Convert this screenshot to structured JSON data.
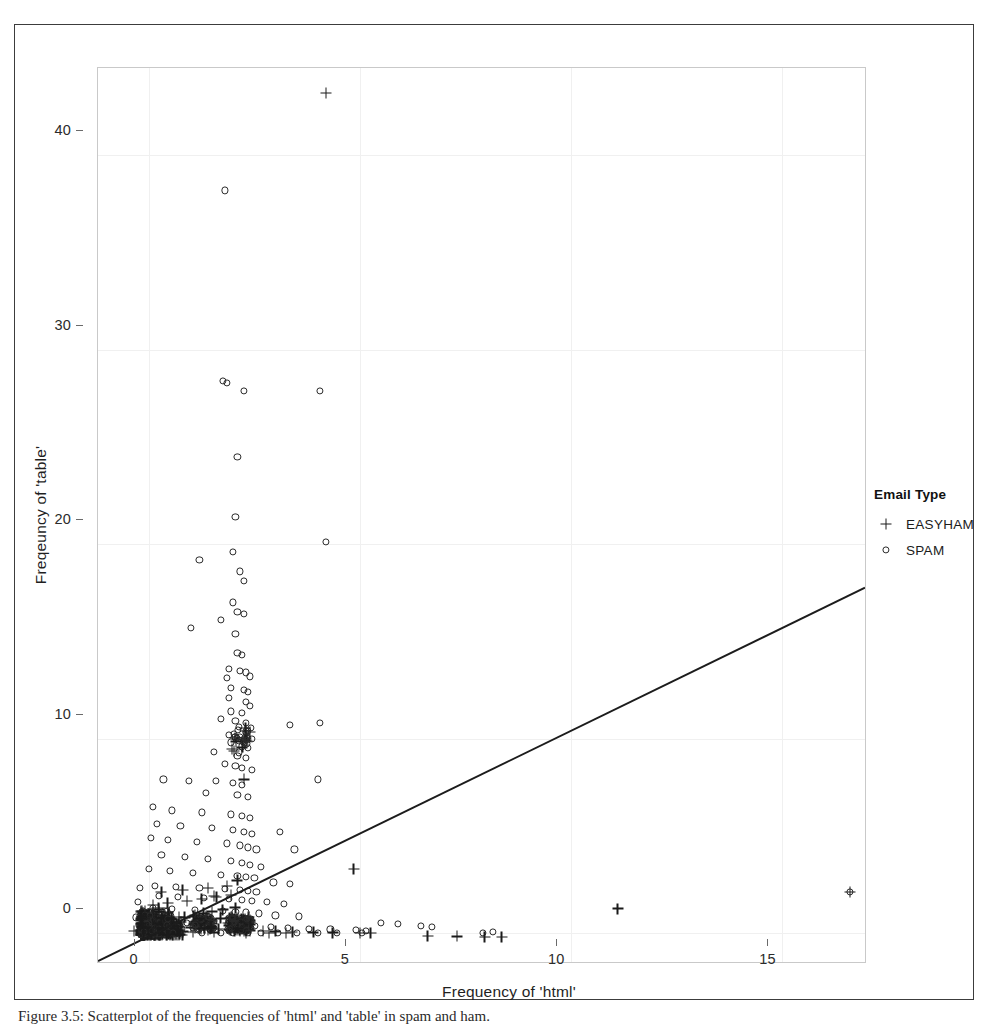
{
  "figure": {
    "caption": "Figure 3.5: Scatterplot of the frequencies of 'html' and 'table' in spam and ham."
  },
  "axes": {
    "x_title": "Frequency of 'html'",
    "y_title": "Freqeuncy of 'table'",
    "x_ticks": [
      "0",
      "5",
      "10",
      "15"
    ],
    "y_ticks": [
      "0",
      "10",
      "20",
      "30",
      "40"
    ]
  },
  "legend": {
    "title": "Email Type",
    "entries": [
      {
        "label": "EASYHAM",
        "marker": "plus-icon",
        "color": "#1a1a1a"
      },
      {
        "label": "SPAM",
        "marker": "circle-open-icon",
        "color": "#2a2a2a"
      }
    ]
  },
  "chart_data": {
    "type": "scatter",
    "title": "",
    "xlabel": "Frequency of 'html'",
    "ylabel": "Freqeuncy of 'table'",
    "xlim": [
      -1.2,
      17.0
    ],
    "ylim": [
      -1.6,
      44.5
    ],
    "xticks": [
      0,
      5,
      10,
      15
    ],
    "yticks": [
      0,
      10,
      20,
      30,
      40
    ],
    "grid": true,
    "legend_position": "right-outside",
    "series": [
      {
        "name": "SPAM",
        "marker": "open-circle",
        "color": "#2a2a2a",
        "points": [
          [
            1.8,
            38.2
          ],
          [
            1.75,
            28.4
          ],
          [
            1.85,
            28.3
          ],
          [
            2.25,
            27.9
          ],
          [
            4.05,
            27.9
          ],
          [
            2.1,
            24.5
          ],
          [
            2.05,
            21.4
          ],
          [
            2.0,
            19.6
          ],
          [
            2.15,
            18.6
          ],
          [
            1.2,
            19.2
          ],
          [
            2.25,
            18.1
          ],
          [
            4.2,
            20.1
          ],
          [
            2.0,
            17.0
          ],
          [
            2.1,
            16.5
          ],
          [
            2.25,
            16.4
          ],
          [
            1.7,
            16.1
          ],
          [
            2.05,
            15.4
          ],
          [
            1.0,
            15.7
          ],
          [
            2.1,
            14.4
          ],
          [
            2.2,
            14.3
          ],
          [
            1.9,
            13.6
          ],
          [
            2.15,
            13.5
          ],
          [
            2.3,
            13.4
          ],
          [
            1.85,
            13.1
          ],
          [
            2.4,
            13.2
          ],
          [
            1.95,
            12.6
          ],
          [
            2.25,
            12.5
          ],
          [
            2.35,
            12.4
          ],
          [
            1.9,
            12.1
          ],
          [
            2.3,
            11.9
          ],
          [
            2.4,
            11.7
          ],
          [
            1.95,
            11.4
          ],
          [
            2.2,
            11.3
          ],
          [
            1.7,
            11.0
          ],
          [
            2.05,
            10.9
          ],
          [
            2.3,
            10.8
          ],
          [
            3.35,
            10.7
          ],
          [
            4.05,
            10.8
          ],
          [
            1.9,
            10.2
          ],
          [
            2.15,
            10.1
          ],
          [
            2.25,
            10.0
          ],
          [
            2.45,
            10.0
          ],
          [
            1.95,
            9.8
          ],
          [
            2.2,
            9.6
          ],
          [
            2.35,
            9.5
          ],
          [
            1.55,
            9.3
          ],
          [
            2.1,
            9.1
          ],
          [
            2.3,
            9.0
          ],
          [
            1.8,
            8.7
          ],
          [
            2.05,
            8.6
          ],
          [
            2.2,
            8.5
          ],
          [
            2.45,
            8.4
          ],
          [
            0.35,
            7.9
          ],
          [
            0.95,
            7.8
          ],
          [
            1.6,
            7.8
          ],
          [
            2.0,
            7.7
          ],
          [
            2.2,
            7.6
          ],
          [
            4.0,
            7.9
          ],
          [
            1.35,
            7.2
          ],
          [
            2.1,
            7.1
          ],
          [
            2.35,
            7.0
          ],
          [
            0.1,
            6.5
          ],
          [
            0.55,
            6.3
          ],
          [
            1.25,
            6.2
          ],
          [
            1.95,
            6.1
          ],
          [
            2.2,
            6.0
          ],
          [
            2.4,
            5.9
          ],
          [
            0.2,
            5.6
          ],
          [
            0.75,
            5.5
          ],
          [
            1.5,
            5.4
          ],
          [
            2.0,
            5.3
          ],
          [
            2.25,
            5.2
          ],
          [
            2.45,
            5.1
          ],
          [
            3.1,
            5.2
          ],
          [
            0.05,
            4.9
          ],
          [
            0.45,
            4.8
          ],
          [
            1.15,
            4.7
          ],
          [
            1.85,
            4.6
          ],
          [
            2.15,
            4.5
          ],
          [
            2.35,
            4.4
          ],
          [
            2.55,
            4.3
          ],
          [
            3.45,
            4.3
          ],
          [
            0.3,
            4.0
          ],
          [
            0.85,
            3.9
          ],
          [
            1.4,
            3.8
          ],
          [
            1.95,
            3.7
          ],
          [
            2.2,
            3.6
          ],
          [
            2.4,
            3.5
          ],
          [
            2.65,
            3.4
          ],
          [
            0.0,
            3.3
          ],
          [
            0.5,
            3.2
          ],
          [
            1.05,
            3.1
          ],
          [
            1.7,
            3.0
          ],
          [
            2.1,
            2.95
          ],
          [
            2.3,
            2.9
          ],
          [
            2.5,
            2.85
          ],
          [
            2.95,
            2.6
          ],
          [
            3.35,
            2.5
          ],
          [
            0.15,
            2.4
          ],
          [
            0.65,
            2.35
          ],
          [
            1.2,
            2.3
          ],
          [
            1.8,
            2.25
          ],
          [
            2.15,
            2.2
          ],
          [
            2.35,
            2.15
          ],
          [
            2.55,
            2.1
          ],
          [
            0.25,
            1.9
          ],
          [
            0.7,
            1.85
          ],
          [
            1.3,
            1.8
          ],
          [
            1.9,
            1.75
          ],
          [
            2.2,
            1.7
          ],
          [
            2.45,
            1.65
          ],
          [
            2.8,
            1.6
          ],
          [
            3.2,
            1.5
          ],
          [
            0.1,
            1.3
          ],
          [
            0.55,
            1.25
          ],
          [
            1.1,
            1.2
          ],
          [
            1.75,
            1.15
          ],
          [
            2.05,
            1.1
          ],
          [
            2.3,
            1.05
          ],
          [
            2.6,
            1.0
          ],
          [
            3.0,
            0.9
          ],
          [
            3.55,
            0.85
          ],
          [
            0.0,
            0.6
          ],
          [
            0.4,
            0.55
          ],
          [
            0.9,
            0.5
          ],
          [
            1.45,
            0.45
          ],
          [
            1.95,
            0.4
          ],
          [
            2.25,
            0.38
          ],
          [
            2.5,
            0.35
          ],
          [
            2.9,
            0.3
          ],
          [
            3.3,
            0.25
          ],
          [
            3.8,
            0.2
          ],
          [
            4.3,
            0.18
          ],
          [
            4.9,
            0.15
          ],
          [
            5.15,
            0.12
          ],
          [
            -0.15,
            0.05
          ],
          [
            0.2,
            0.04
          ],
          [
            0.7,
            0.03
          ],
          [
            1.25,
            0.02
          ],
          [
            1.7,
            0.02
          ],
          [
            2.0,
            0.0
          ],
          [
            2.35,
            0.0
          ],
          [
            2.65,
            0.0
          ],
          [
            3.05,
            0.0
          ],
          [
            3.5,
            0.0
          ],
          [
            4.0,
            0.0
          ],
          [
            4.45,
            0.0
          ],
          [
            5.05,
            0.0
          ],
          [
            7.9,
            0.0
          ],
          [
            8.15,
            0.05
          ],
          [
            16.6,
            2.1
          ],
          [
            6.45,
            0.35
          ],
          [
            6.7,
            0.3
          ],
          [
            5.5,
            0.5
          ],
          [
            5.9,
            0.45
          ],
          [
            -0.3,
            0.8
          ],
          [
            -0.25,
            1.6
          ],
          [
            -0.2,
            2.3
          ],
          [
            -0.1,
            0.35
          ],
          [
            0.05,
            1.05
          ]
        ]
      },
      {
        "name": "EASYHAM",
        "marker": "plus",
        "color": "#1a1a1a",
        "points": [
          [
            4.2,
            43.2
          ],
          [
            2.25,
            7.9
          ],
          [
            4.85,
            3.3
          ],
          [
            11.1,
            1.25
          ],
          [
            16.6,
            2.1
          ],
          [
            2.1,
            2.7
          ],
          [
            1.55,
            1.9
          ],
          [
            1.35,
            0.85
          ],
          [
            1.7,
            0.75
          ],
          [
            2.0,
            0.6
          ],
          [
            0.0,
            0.45
          ],
          [
            0.25,
            0.4
          ],
          [
            0.5,
            0.35
          ],
          [
            0.75,
            0.3
          ],
          [
            1.0,
            0.28
          ],
          [
            1.2,
            0.25
          ],
          [
            1.45,
            0.22
          ],
          [
            1.65,
            0.2
          ],
          [
            1.9,
            0.18
          ],
          [
            2.15,
            0.15
          ],
          [
            2.4,
            0.12
          ],
          [
            2.7,
            0.1
          ],
          [
            3.0,
            0.08
          ],
          [
            3.4,
            0.05
          ],
          [
            3.9,
            0.03
          ],
          [
            4.35,
            0.02
          ],
          [
            5.0,
            0.0
          ],
          [
            5.25,
            0.0
          ],
          [
            6.6,
            -0.15
          ],
          [
            7.3,
            -0.18
          ],
          [
            7.95,
            -0.2
          ],
          [
            8.35,
            -0.22
          ],
          [
            -0.35,
            0.1
          ],
          [
            -0.2,
            0.15
          ],
          [
            -0.05,
            0.2
          ],
          [
            0.15,
            0.55
          ],
          [
            0.35,
            0.65
          ],
          [
            0.55,
            0.7
          ],
          [
            0.85,
            0.8
          ],
          [
            1.1,
            0.9
          ],
          [
            1.3,
            1.0
          ],
          [
            1.5,
            1.1
          ],
          [
            1.75,
            1.2
          ],
          [
            2.05,
            1.3
          ],
          [
            0.1,
            1.45
          ],
          [
            0.45,
            1.55
          ],
          [
            0.9,
            1.65
          ],
          [
            1.25,
            1.75
          ],
          [
            1.6,
            1.85
          ],
          [
            1.95,
            1.95
          ],
          [
            0.3,
            2.1
          ],
          [
            0.8,
            2.2
          ],
          [
            1.4,
            2.3
          ],
          [
            1.85,
            2.4
          ],
          [
            0.6,
            0.05
          ],
          [
            1.05,
            0.04
          ],
          [
            1.55,
            0.03
          ],
          [
            2.3,
            0.02
          ],
          [
            2.85,
            0.0
          ],
          [
            3.25,
            0.0
          ]
        ]
      }
    ],
    "fit_line": {
      "name": "linear-fit",
      "color": "#1c1c1c",
      "x0": -1.2,
      "y0": -1.55,
      "x1": 17.0,
      "y1": 17.7
    }
  }
}
